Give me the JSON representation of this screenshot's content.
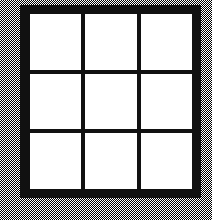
{
  "figure": {
    "canvas": {
      "width_px": 212,
      "height_px": 220
    },
    "colors": {
      "frame": "#111111",
      "mullion": "#111111",
      "pane": "#ffffff",
      "background_dither_dark": "#000000",
      "background_dither_light": "#ffffff",
      "background_effective": "#a8a8a8"
    },
    "frame": {
      "left_px": 20,
      "top_px": 5,
      "width_px": 181,
      "height_px": 193,
      "border_px": 9
    },
    "grid": {
      "rows": 3,
      "columns": 3,
      "cell_count": 9,
      "mullion_px": 4,
      "vertical_mullion_centers_px": [
        84,
        144
      ],
      "horizontal_mullion_centers_px": [
        72,
        134
      ]
    },
    "panes": [
      {
        "id": "pane-r1c1",
        "row": 1,
        "column": 1,
        "label": "",
        "fill": "#ffffff"
      },
      {
        "id": "pane-r1c2",
        "row": 1,
        "column": 2,
        "label": "",
        "fill": "#ffffff"
      },
      {
        "id": "pane-r1c3",
        "row": 1,
        "column": 3,
        "label": "",
        "fill": "#ffffff"
      },
      {
        "id": "pane-r2c1",
        "row": 2,
        "column": 1,
        "label": "",
        "fill": "#ffffff"
      },
      {
        "id": "pane-r2c2",
        "row": 2,
        "column": 2,
        "label": "",
        "fill": "#ffffff"
      },
      {
        "id": "pane-r2c3",
        "row": 2,
        "column": 3,
        "label": "",
        "fill": "#ffffff"
      },
      {
        "id": "pane-r3c1",
        "row": 3,
        "column": 1,
        "label": "",
        "fill": "#ffffff"
      },
      {
        "id": "pane-r3c2",
        "row": 3,
        "column": 2,
        "label": "",
        "fill": "#ffffff"
      },
      {
        "id": "pane-r3c3",
        "row": 3,
        "column": 3,
        "label": "",
        "fill": "#ffffff"
      }
    ]
  }
}
